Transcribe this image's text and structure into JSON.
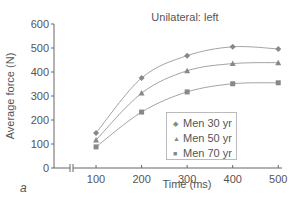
{
  "chart_data": {
    "type": "line",
    "title": "Unilateral: left",
    "xlabel": "Time (ms)",
    "ylabel": "Average force (N)",
    "panel_label": "a",
    "x": [
      100,
      200,
      300,
      400,
      500
    ],
    "x_ticks": [
      "100",
      "200",
      "300",
      "400",
      "500"
    ],
    "y_ticks": [
      "0",
      "100",
      "200",
      "300",
      "400",
      "500",
      "600"
    ],
    "ylim": [
      0,
      600
    ],
    "xlim": [
      0,
      500
    ],
    "axis_break": true,
    "grid": false,
    "legend_position": "lower right inside",
    "series": [
      {
        "name": "Men 30 yr",
        "marker": "diamond",
        "values": [
          146,
          375,
          468,
          505,
          496
        ]
      },
      {
        "name": "Men 50 yr",
        "marker": "triangle",
        "values": [
          117,
          312,
          405,
          435,
          439
        ]
      },
      {
        "name": "Men 70 yr",
        "marker": "square",
        "values": [
          88,
          233,
          317,
          351,
          355
        ]
      }
    ],
    "colors": {
      "line": "#999999",
      "marker": "#888888",
      "text": "#555555"
    }
  }
}
